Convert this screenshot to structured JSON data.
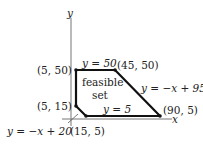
{
  "axes": {
    "x_label": "x",
    "y_label": "y"
  },
  "region": {
    "label_line1": "feasible",
    "label_line2": "set"
  },
  "vertices": [
    {
      "label": "(5, 50)"
    },
    {
      "label": "(45, 50)"
    },
    {
      "label": "(90, 5)"
    },
    {
      "label": "(15, 5)"
    },
    {
      "label": "(5, 15)"
    }
  ],
  "constraints": [
    {
      "label": "y = 50"
    },
    {
      "label": "y = −x + 95"
    },
    {
      "label": "y = 5"
    },
    {
      "label": "y = −x + 20"
    }
  ],
  "colors": {
    "boundary": "#111111",
    "axis": "#777777",
    "text": "#222222"
  }
}
